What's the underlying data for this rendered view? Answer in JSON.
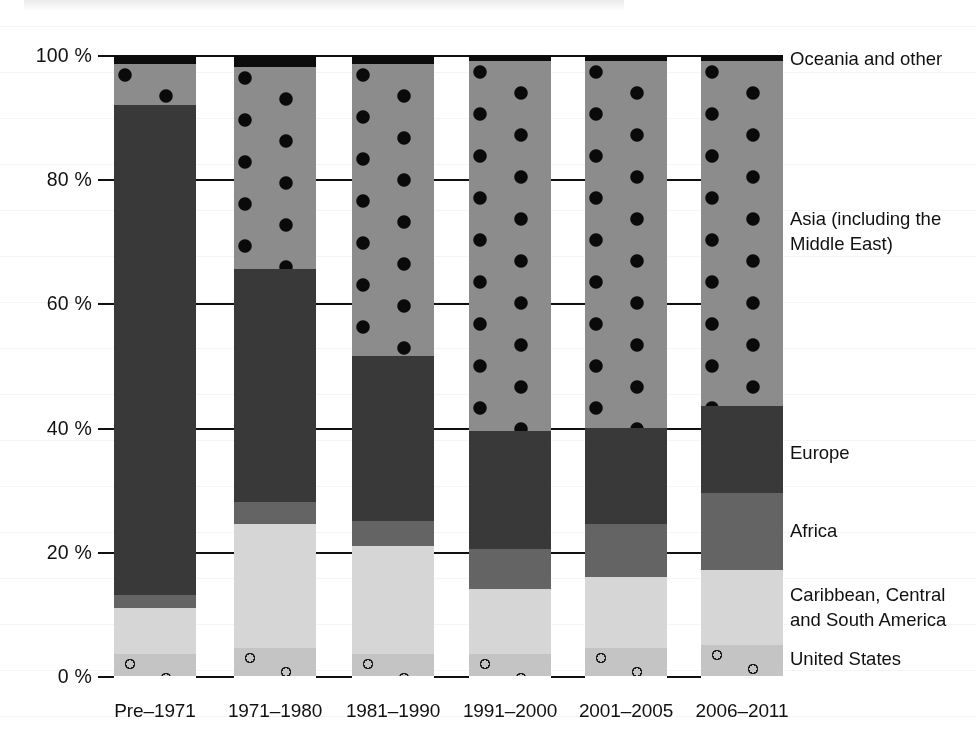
{
  "chart_data": {
    "type": "bar",
    "subtype": "stacked-percentage-column",
    "title": "",
    "subtitle": "",
    "xlabel": "",
    "ylabel": "",
    "ylim": [
      0,
      100
    ],
    "yunit": "%",
    "grid": false,
    "legend_position": "right",
    "categories": [
      "Pre–1971",
      "1971–1980",
      "1981–1990",
      "1991–2000",
      "2001–2005",
      "2006–2011"
    ],
    "ytick_labels": [
      "100 %",
      "80 %",
      "60 %",
      "40 %",
      "20 %",
      "0 %"
    ],
    "ytick_values": [
      100,
      80,
      60,
      40,
      20,
      0
    ],
    "series": [
      {
        "name": "United States",
        "values": [
          3.5,
          4.5,
          3.5,
          3.5,
          4.5,
          5.0
        ]
      },
      {
        "name": "Caribbean, Central and South America",
        "values": [
          7.5,
          20.0,
          17.5,
          10.5,
          11.5,
          12.0
        ]
      },
      {
        "name": "Africa",
        "values": [
          2.0,
          3.5,
          4.0,
          6.5,
          8.5,
          12.5
        ]
      },
      {
        "name": "Europe",
        "values": [
          79.0,
          37.5,
          26.5,
          19.0,
          15.5,
          14.0
        ]
      },
      {
        "name": "Asia (including the Middle East)",
        "values": [
          6.5,
          32.5,
          47.0,
          59.5,
          59.0,
          55.5
        ]
      },
      {
        "name": "Oceania and other",
        "values": [
          1.5,
          2.0,
          1.5,
          1.0,
          1.0,
          1.0
        ]
      }
    ],
    "cumulative_tops": [
      {
        "category": "Pre–1971",
        "United States": 3.5,
        "Caribbean, Central and South America": 11.0,
        "Africa": 13.0,
        "Europe": 92.0,
        "Asia (including the Middle East)": 98.5,
        "Oceania and other": 100
      },
      {
        "category": "1971–1980",
        "United States": 4.5,
        "Caribbean, Central and South America": 24.5,
        "Africa": 28.0,
        "Europe": 65.5,
        "Asia (including the Middle East)": 98.0,
        "Oceania and other": 100
      },
      {
        "category": "1981–1990",
        "United States": 3.5,
        "Caribbean, Central and South America": 21.0,
        "Africa": 25.0,
        "Europe": 51.5,
        "Asia (including the Middle East)": 98.5,
        "Oceania and other": 100
      },
      {
        "category": "1991–2000",
        "United States": 3.5,
        "Caribbean, Central and South America": 14.0,
        "Africa": 20.5,
        "Europe": 39.5,
        "Asia (including the Middle East)": 99.0,
        "Oceania and other": 100
      },
      {
        "category": "2001–2005",
        "United States": 4.5,
        "Caribbean, Central and South America": 16.0,
        "Africa": 24.5,
        "Europe": 40.0,
        "Asia (including the Middle East)": 99.0,
        "Oceania and other": 100
      },
      {
        "category": "2006–2011",
        "United States": 5.0,
        "Caribbean, Central and South America": 17.0,
        "Africa": 29.5,
        "Europe": 43.5,
        "Asia (including the Middle East)": 99.0,
        "Oceania and other": 100
      }
    ],
    "legend_entries": [
      {
        "label": "Oceania and other",
        "color": "#0c0c0c",
        "pattern": "solid"
      },
      {
        "label": "Asia (including the\nMiddle East)",
        "color": "#8c8c8c",
        "pattern": "filled-dots"
      },
      {
        "label": "Europe",
        "color": "#393939",
        "pattern": "solid"
      },
      {
        "label": "Africa",
        "color": "#646464",
        "pattern": "solid"
      },
      {
        "label": "Caribbean, Central\nand South America",
        "color": "#d6d6d6",
        "pattern": "solid"
      },
      {
        "label": "United States",
        "color": "#c4c4c4",
        "pattern": "open-circles"
      }
    ],
    "colors": {
      "oceania": "#0c0c0c",
      "asia": "#8c8c8c",
      "europe": "#393939",
      "africa": "#646464",
      "caribbean": "#d6d6d6",
      "united_states": "#c4c4c4",
      "axis": "#111111",
      "background": "#ffffff"
    }
  }
}
